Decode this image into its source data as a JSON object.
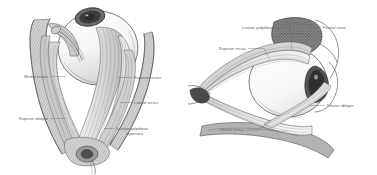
{
  "figure": {
    "background_color": "#ffffff",
    "ink_color": "#3a3a3a",
    "label_color": "#5b5b5b",
    "style": "grayscale anatomical engraving"
  },
  "panels": [
    {
      "id": "anterior",
      "name": "anterior-view",
      "caption": "",
      "labels": [
        {
          "id": "medial-rectus",
          "text": "Medial rectus",
          "lines": [
            "Medial rectus"
          ],
          "side": "left",
          "x": 12,
          "y": 78
        },
        {
          "id": "superior-oblique",
          "text": "Superior oblique",
          "lines": [
            "Superior oblique"
          ],
          "side": "left",
          "x": 12,
          "y": 120
        },
        {
          "id": "superior-rectus",
          "text": "Superior rectus",
          "lines": [
            "Superior rectus"
          ],
          "side": "right",
          "x": 134,
          "y": 79
        },
        {
          "id": "lateral-rectus",
          "text": "Lateral rectus",
          "lines": [
            "Lateral rectus"
          ],
          "side": "right",
          "x": 134,
          "y": 104
        },
        {
          "id": "levator-palpebrae",
          "text": "Levator palpebrae superioris",
          "lines": [
            "Levator palpebrae",
            "superioris"
          ],
          "side": "right",
          "x": 116,
          "y": 130
        }
      ]
    },
    {
      "id": "lateral",
      "name": "lateral-view",
      "caption": "",
      "labels": [
        {
          "id": "levator-palpebrae-2",
          "text": "Levator palpebrae",
          "lines": [
            "Levator palpebrae"
          ],
          "side": "left",
          "x": 228,
          "y": 29
        },
        {
          "id": "frontal-sinus",
          "text": "Frontal sinus",
          "lines": [
            "Frontal sinus"
          ],
          "side": "right",
          "x": 322,
          "y": 29
        },
        {
          "id": "superior-rectus-2",
          "text": "Superior rectus",
          "lines": [
            "Superior rectus"
          ],
          "side": "left",
          "x": 200,
          "y": 50
        },
        {
          "id": "inferior-oblique",
          "text": "Inferior oblique",
          "lines": [
            "Inferior oblique"
          ],
          "side": "right",
          "x": 327,
          "y": 107
        },
        {
          "id": "inferior-rectus",
          "text": "Inferior rectus",
          "lines": [
            "Inferior rectus"
          ],
          "side": "left",
          "x": 216,
          "y": 131
        }
      ]
    }
  ],
  "structures": {
    "anterior": [
      "eyeball",
      "cornea-iris",
      "superior-rectus",
      "lateral-rectus",
      "medial-rectus",
      "superior-oblique",
      "levator-palpebrae-superioris",
      "optic-nerve-apex",
      "orbital-wall"
    ],
    "lateral": [
      "eyeball",
      "cornea",
      "frontal-sinus-bone",
      "levator-palpebrae",
      "superior-rectus",
      "inferior-rectus",
      "inferior-oblique",
      "orbital-floor",
      "optic-nerve"
    ]
  }
}
